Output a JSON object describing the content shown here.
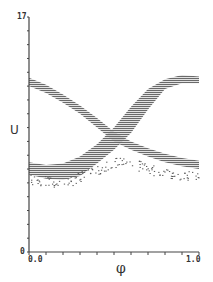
{
  "chart_data": {
    "type": "scatter",
    "title": "",
    "xlabel": "φ",
    "ylabel": "U",
    "xlim": [
      0.0,
      1.0
    ],
    "ylim": [
      0,
      17
    ],
    "x_tick_labels": [
      "0.0",
      "1.0"
    ],
    "y_tick_labels": [
      "0",
      "17"
    ],
    "x_minor_ticks": 10,
    "y_minor_ticks": 17,
    "grid": false,
    "legend": null,
    "series": [
      {
        "name": "band-descending",
        "description": "dense hatched band from upper-left falling to lower-right",
        "x": [
          0.0,
          0.1,
          0.2,
          0.3,
          0.4,
          0.5,
          0.6,
          0.7,
          0.8,
          0.9,
          1.0
        ],
        "upper": [
          12.6,
          12.1,
          11.4,
          10.6,
          9.7,
          8.7,
          8.0,
          7.5,
          7.1,
          6.8,
          6.6
        ],
        "lower": [
          12.0,
          11.5,
          10.8,
          10.0,
          9.0,
          8.0,
          7.4,
          6.9,
          6.5,
          6.2,
          6.0
        ]
      },
      {
        "name": "band-ascending",
        "description": "dense hatched band from lower-left rising to upper-right",
        "x": [
          0.0,
          0.1,
          0.2,
          0.3,
          0.4,
          0.5,
          0.6,
          0.7,
          0.8,
          0.9,
          1.0
        ],
        "upper": [
          6.5,
          6.3,
          6.4,
          6.9,
          7.8,
          9.0,
          10.5,
          11.8,
          12.5,
          12.8,
          12.7
        ],
        "lower": [
          5.6,
          5.3,
          5.2,
          5.5,
          6.4,
          7.4,
          8.6,
          10.3,
          11.8,
          12.2,
          12.2
        ]
      },
      {
        "name": "scattered-points",
        "description": "sparse dots beneath bands",
        "x": [
          0.0,
          0.1,
          0.2,
          0.3,
          0.4,
          0.5,
          0.6,
          0.7,
          0.8,
          0.9,
          1.0
        ],
        "y": [
          5.3,
          5.1,
          5.0,
          5.4,
          6.0,
          6.5,
          6.4,
          6.0,
          5.8,
          5.6,
          5.3
        ]
      }
    ]
  },
  "labels": {
    "y_top": "17",
    "y_bottom": "0",
    "x_left": "0.0",
    "x_right": "1.0",
    "xlabel": "φ",
    "ylabel": "U"
  }
}
